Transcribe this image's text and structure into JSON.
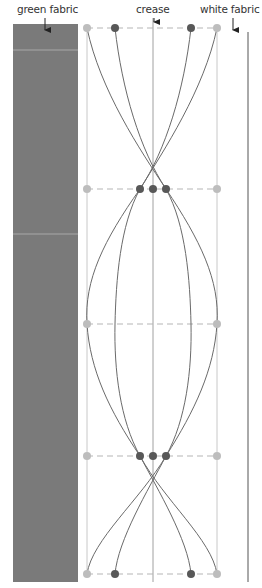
{
  "labels": {
    "green_fabric": "green fabric",
    "crease": "crease",
    "white_fabric": "white fabric"
  },
  "colors": {
    "green_fabric_fill": "#7a7a7a",
    "green_fabric_stripe": "#a8a8a8",
    "guide_line": "#c8c8c8",
    "crease_line": "#999999",
    "edge_line": "#555555",
    "curve": "#6a6a6a",
    "dash": "#b5b5b5",
    "dot_light": "#bdbdbd",
    "dot_dark": "#585858",
    "arrow": "#222222"
  },
  "diagram": {
    "fabric_rect": {
      "x": 13,
      "y": 24,
      "w": 65,
      "h": 558
    },
    "fabric_stripes_y": [
      50,
      234
    ],
    "guides_x": {
      "left": 87,
      "crease": 153,
      "right": 217,
      "white_edge": 248
    },
    "rows_y": [
      28,
      189,
      324,
      456,
      574
    ],
    "dots": [
      {
        "x": 87,
        "y": 28,
        "tone": "light"
      },
      {
        "x": 115,
        "y": 28,
        "tone": "dark"
      },
      {
        "x": 191,
        "y": 28,
        "tone": "dark"
      },
      {
        "x": 217,
        "y": 28,
        "tone": "light"
      },
      {
        "x": 87,
        "y": 189,
        "tone": "light"
      },
      {
        "x": 140,
        "y": 189,
        "tone": "dark"
      },
      {
        "x": 153,
        "y": 189,
        "tone": "dark"
      },
      {
        "x": 166,
        "y": 189,
        "tone": "dark"
      },
      {
        "x": 217,
        "y": 189,
        "tone": "light"
      },
      {
        "x": 87,
        "y": 324,
        "tone": "light"
      },
      {
        "x": 217,
        "y": 324,
        "tone": "light"
      },
      {
        "x": 87,
        "y": 456,
        "tone": "light"
      },
      {
        "x": 140,
        "y": 456,
        "tone": "dark"
      },
      {
        "x": 153,
        "y": 456,
        "tone": "dark"
      },
      {
        "x": 166,
        "y": 456,
        "tone": "dark"
      },
      {
        "x": 217,
        "y": 456,
        "tone": "light"
      },
      {
        "x": 87,
        "y": 574,
        "tone": "light"
      },
      {
        "x": 115,
        "y": 574,
        "tone": "dark"
      },
      {
        "x": 191,
        "y": 574,
        "tone": "dark"
      },
      {
        "x": 217,
        "y": 574,
        "tone": "light"
      }
    ]
  }
}
